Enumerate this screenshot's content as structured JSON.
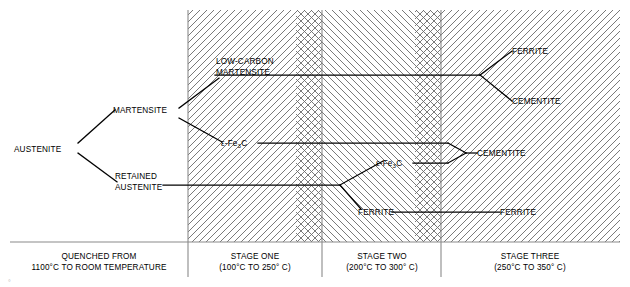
{
  "diagram": {
    "phase_labels": {
      "austenite": "AUSTENITE",
      "martensite": "MARTENSITE",
      "retained_austenite_line1": "RETAINED",
      "retained_austenite_line2": "AUSTENITE",
      "low_carbon_martensite_line1": "LOW-CARBON",
      "low_carbon_martensite_line2": "MARTENSITE",
      "epsilon_carbide_stage_one": "ε-Fe₃C",
      "epsilon_carbide_stage_two": "ε-Fe₃C",
      "ferrite_stage_two": "FERRITE",
      "ferrite_stage_three_lower": "FERRITE",
      "ferrite_stage_three_upper": "FERRITE",
      "cementite_stage_three_upper": "CEMENTITE",
      "cementite_stage_three_mid": "CEMENTITE"
    },
    "epsilon_carbide_parts": {
      "epsilon_dash_fe": "ε-Fe",
      "subscript": "3",
      "carbon": "C"
    },
    "columns": [
      {
        "id": "quenched",
        "line1": "QUENCHED FROM",
        "line2": "1100°C TO ROOM TEMPERATURE"
      },
      {
        "id": "stage-one",
        "line1": "STAGE ONE",
        "line2": "(100°C TO 250° C)"
      },
      {
        "id": "stage-two",
        "line1": "STAGE TWO",
        "line2": "(200°C TO 300° C)"
      },
      {
        "id": "stage-three",
        "line1": "STAGE THREE",
        "line2": "(250°C TO 350° C)"
      }
    ],
    "scan_artifact": "°",
    "colors": {
      "line": "#000000",
      "hatch": "#6b6b6b",
      "rule": "#8a8a8a",
      "background": "#ffffff"
    }
  }
}
